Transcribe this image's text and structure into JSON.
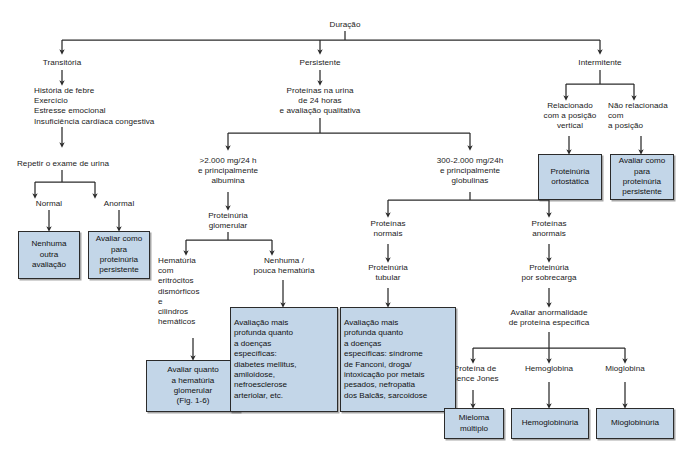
{
  "diagram": {
    "title": "Duração",
    "colors": {
      "box_fill": "#c3d6e8",
      "box_border": "#2b2b2b",
      "line": "#2b2b2b",
      "text": "#111111",
      "background": "#ffffff"
    },
    "root": "Duração",
    "branches": {
      "transitoria": "Transitória",
      "persistente": "Persistente",
      "intermitente": "Intermitente"
    },
    "nodes": {
      "root": "Duração",
      "transitoria": "Transitória",
      "persistente": "Persistente",
      "intermitente": "Intermitente",
      "causas_transitorias": "História de febre\nExercício\nEstresse emocional\nInsuficiência cardíaca congestiva",
      "repetir_exame": "Repetir o exame de urina",
      "normal": "Normal",
      "anormal": "Anormal",
      "proteinas_urina_24h": "Proteínas na urina\nde 24 horas\ne avaliação qualitativa",
      "maior_2000": ">2.000 mg/24 h\ne principalmente\nalbumina",
      "faixa_300_2000": "300-2.000 mg/24h\ne principalmente\nglobulinas",
      "proteinuria_glomerular": "Proteinúria\nglomerular",
      "hematuria_dismorfica": "Hematúria\n   com\n   eritrócitos\n   dismórficos\n   e\n   cilindros\n   hemáticos",
      "nenhuma_pouca_hematuria": "Nenhuma /\npouca hematúria",
      "proteinas_normais": "Proteínas\nnormais",
      "proteinas_anormais": "Proteínas\nanormais",
      "proteinuria_tubular": "Proteinúria\ntubular",
      "proteinuria_sobrecarga": "Proteinúria\npor sobrecarga",
      "avaliar_anormalidade": "Avaliar anormalidade\nde proteína específica",
      "bence_jones": "Proteína de\nBence Jones",
      "hemoglobina": "Hemoglobina",
      "mioglobina": "Mioglobina",
      "relacionado_posicao": "Relacionado\ncom a posição\nvertical",
      "nao_relacionado_posicao": "Não relacionada\ncom\na posição"
    },
    "boxes": {
      "nenhuma_outra_avaliacao": "Nenhuma\noutra\navaliação",
      "avaliar_como_persistente_left": "Avaliar como\npara\nproteinúria\npersistente",
      "avaliar_hematuria_glomerular": "Avaliar quanto\na hematúria\nglomerular\n(Fig. 1-6)",
      "avaliacao_doencas_especificas": "Avaliação mais\n  profunda quanto\n  a doenças\n  específicas:\n  diabetes mellitus,\n  amiloidose,\n  nefroesclerose\n  arteriolar, etc.",
      "avaliacao_tubular": "Avaliação mais\n  profunda quanto\n  a doenças\n  específicas: síndrome\n  de Fanconi, droga/\n  intoxicação por metais\n  pesados, nefropatia\n  dos Balcãs, sarcoidose",
      "proteinuria_ortostatica": "Proteinúria\nortostática",
      "avaliar_como_persistente_right": "Avaliar como\npara\nproteinúria\npersistente",
      "mieloma_multiplo": "Mieloma\nmúltiplo",
      "hemoglobinuria": "Hemoglobinúria",
      "mioglobinuria": "Mioglobinúria"
    }
  }
}
